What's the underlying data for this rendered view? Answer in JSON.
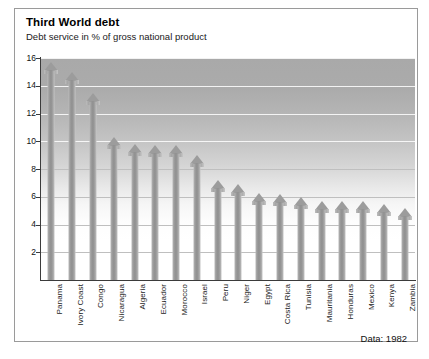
{
  "figure": {
    "title": "Third World debt",
    "subtitle": "Debt service in % of gross national product",
    "source_note": "Data: 1982"
  },
  "axes": {
    "y_ticks": [
      "16",
      "14",
      "12",
      "10",
      "8",
      "6",
      "4",
      "2"
    ],
    "y_min": 0,
    "y_max": 16
  },
  "chart_data": {
    "type": "bar",
    "title": "Third World debt",
    "subtitle": "Debt service in % of gross national product",
    "xlabel": "",
    "ylabel": "Debt service in % of gross national product",
    "ylim": [
      0,
      16
    ],
    "yticks": [
      2,
      4,
      6,
      8,
      10,
      12,
      14,
      16
    ],
    "grid": true,
    "legend": false,
    "annotation": "Data: 1982",
    "categories": [
      "Panama",
      "Ivory Coast",
      "Congo",
      "Nicaragua",
      "Algeria",
      "Ecuador",
      "Morocco",
      "Israel",
      "Peru",
      "Niger",
      "Egypt",
      "Costa Rica",
      "Tunisia",
      "Mauritania",
      "Honduras",
      "Mexico",
      "Kenya",
      "Zambia"
    ],
    "values": [
      15.7,
      15.0,
      13.5,
      10.3,
      9.8,
      9.7,
      9.7,
      9.0,
      7.2,
      6.9,
      6.3,
      6.2,
      6.0,
      5.7,
      5.7,
      5.7,
      5.5,
      5.2
    ],
    "bar_style": "upward-arrow",
    "colors": {
      "bar": "#989898",
      "plot_background_top": "#a9a9a9",
      "plot_background_bottom": "#ffffff",
      "gridline": "#bfbfbf",
      "axis": "#3b3b3b",
      "frame": "#9a9a9a",
      "text": "#000000"
    }
  }
}
